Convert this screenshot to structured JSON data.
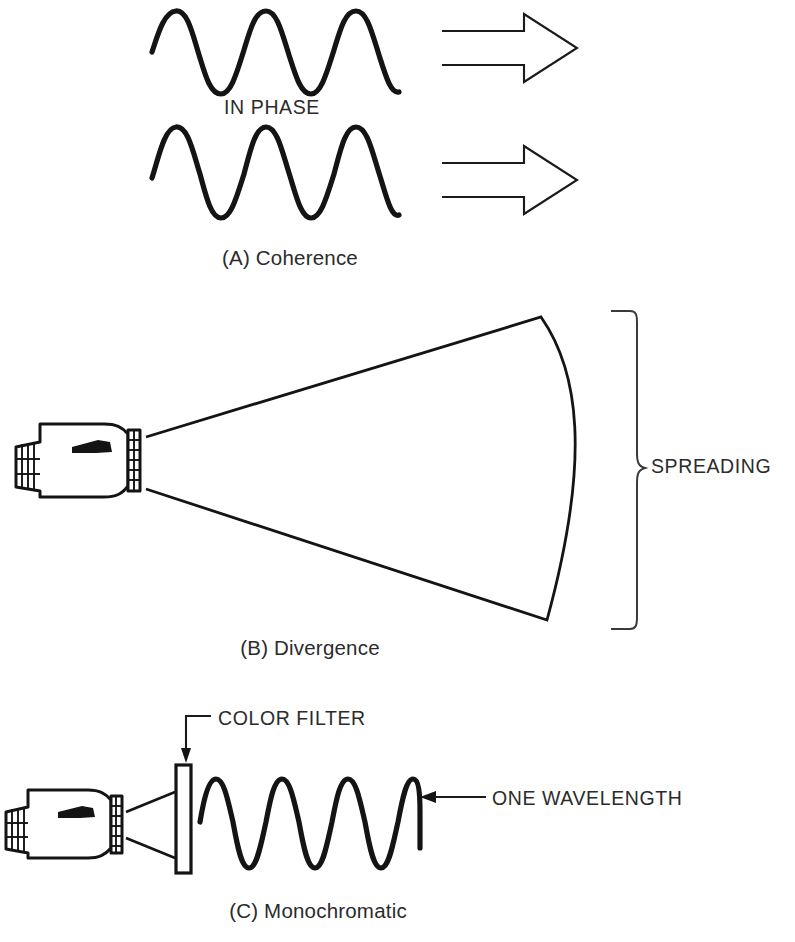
{
  "figure": {
    "ink_color": "#141414",
    "text_color": "#2b2b2b",
    "background": "#ffffff"
  },
  "panels": [
    {
      "id": "a",
      "caption": "(A) Coherence",
      "inner_label": "IN PHASE",
      "waves": [
        {
          "name": "wave-top",
          "cycles": 4,
          "start_x": 152,
          "end_x": 400,
          "peak_y": 10,
          "trough_y": 92
        },
        {
          "name": "wave-bottom",
          "cycles": 4,
          "start_x": 152,
          "end_x": 400,
          "peak_y": 127,
          "trough_y": 218
        }
      ],
      "arrows": [
        {
          "name": "direction-arrow-top",
          "x1": 442,
          "x2": 577,
          "y": 48
        },
        {
          "name": "direction-arrow-bottom",
          "x1": 442,
          "x2": 577,
          "y": 180
        }
      ]
    },
    {
      "id": "b",
      "caption": "(B) Divergence",
      "bracket_label": "SPREADING",
      "flashlight": {
        "name": "flashlight-b",
        "x": 16,
        "y": 424,
        "lens_x": 140
      },
      "cone": {
        "apex_top_y": 437,
        "apex_bottom_y": 489,
        "far_top_y": 317,
        "far_bottom_y": 620,
        "far_x": 545
      }
    },
    {
      "id": "c",
      "caption": "(C) Monochromatic",
      "filter_label": "COLOR FILTER",
      "wavelength_label": "ONE WAVELENGTH",
      "flashlight": {
        "name": "flashlight-c",
        "x": 5,
        "y": 790,
        "lens_x": 122
      },
      "filter": {
        "x": 176,
        "y": 765,
        "width": 15,
        "height": 108
      },
      "wave": {
        "name": "wave-monochromatic",
        "cycles": 5,
        "start_x": 200,
        "end_x": 420,
        "peak_y": 778,
        "trough_y": 868
      }
    }
  ]
}
